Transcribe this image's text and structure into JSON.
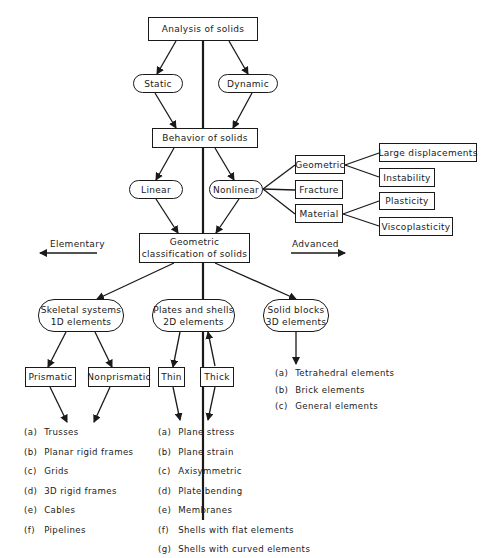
{
  "diagram": {
    "nodes": {
      "analysis": "Analysis of solids",
      "static": "Static",
      "dynamic": "Dynamic",
      "behavior": "Behavior of solids",
      "linear": "Linear",
      "nonlinear": "Nonlinear",
      "geometric": "Geometric",
      "fracture": "Fracture",
      "material": "Material",
      "large_displacements": "Large displacements",
      "instability": "Instability",
      "plasticity": "Plasticity",
      "viscoplasticity": "Viscoplasticity",
      "geo_class_line1": "Geometric",
      "geo_class_line2": "classification of solids",
      "skeletal_line1": "Skeletal systems",
      "skeletal_line2": "1D elements",
      "plates_line1": "Plates and shells",
      "plates_line2": "2D elements",
      "solid_line1": "Solid blocks",
      "solid_line2": "3D elements",
      "prismatic": "Prismatic",
      "nonprismatic": "Nonprismatic",
      "thin": "Thin",
      "thick": "Thick"
    },
    "axis_labels": {
      "elementary": "Elementary",
      "advanced": "Advanced"
    },
    "lists": {
      "skeletal": [
        {
          "tag": "(a)",
          "text": "Trusses"
        },
        {
          "tag": "(b)",
          "text": "Planar rigid frames"
        },
        {
          "tag": "(c)",
          "text": "Grids"
        },
        {
          "tag": "(d)",
          "text": "3D rigid frames"
        },
        {
          "tag": "(e)",
          "text": "Cables"
        },
        {
          "tag": "(f)",
          "text": "Pipelines"
        }
      ],
      "plates": [
        {
          "tag": "(a)",
          "text": "Plane stress"
        },
        {
          "tag": "(b)",
          "text": "Plane strain"
        },
        {
          "tag": "(c)",
          "text": "Axisymmetric"
        },
        {
          "tag": "(d)",
          "text": "Plate bending"
        },
        {
          "tag": "(e)",
          "text": "Membranes"
        },
        {
          "tag": "(f)",
          "text": "Shells with flat elements"
        },
        {
          "tag": "(g)",
          "text": "Shells with curved elements"
        }
      ],
      "solid": [
        {
          "tag": "(a)",
          "text": "Tetrahedral elements"
        },
        {
          "tag": "(b)",
          "text": "Brick elements"
        },
        {
          "tag": "(c)",
          "text": "General elements"
        }
      ]
    }
  }
}
